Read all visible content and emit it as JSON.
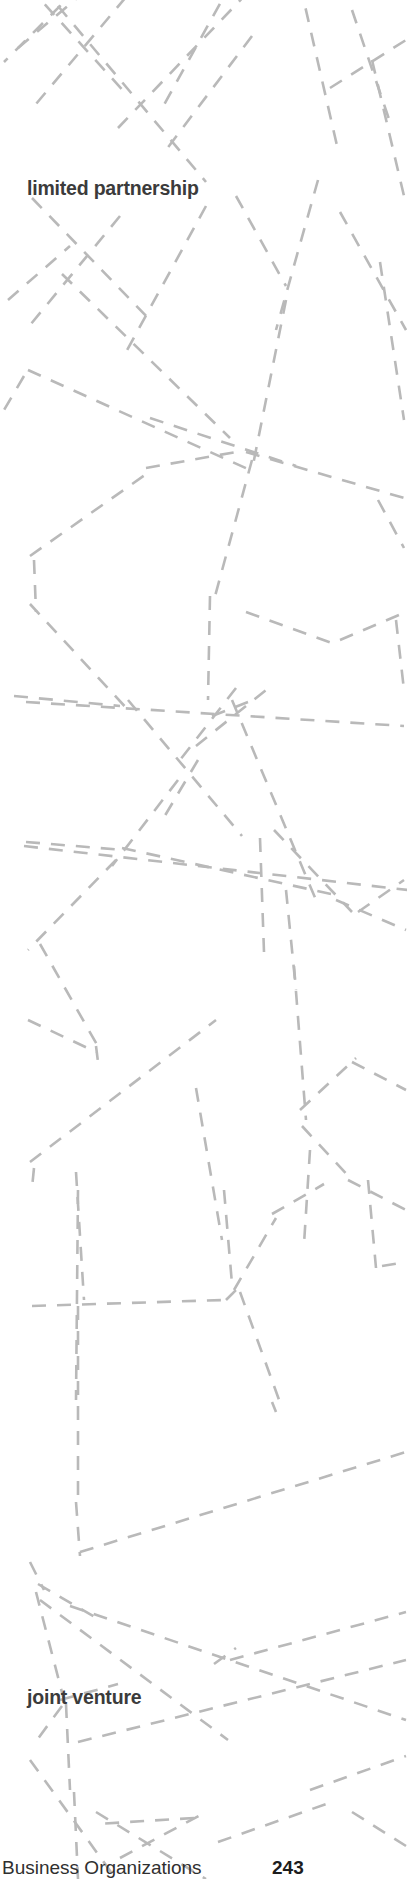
{
  "page": {
    "width": 407,
    "height": 1879,
    "background_color": "#ffffff"
  },
  "graphic": {
    "name": "dashed-network-illustration",
    "description": "Abstract background illustration of intersecting gray dashed lines forming an irregular network",
    "stroke_color": "#b9b9b9",
    "stroke_width": 2.6,
    "dash_pattern": "14 11"
  },
  "labels": {
    "limited_partnership": "limited partnership",
    "joint_venture": "joint venture",
    "text_color": "#3b3b3b"
  },
  "footer": {
    "title": "Business Organizations",
    "page_number": "243"
  }
}
